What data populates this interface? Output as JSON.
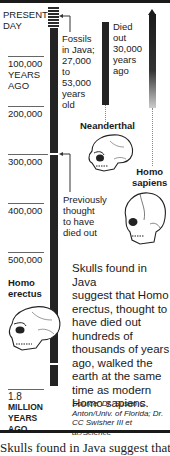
{
  "timeline": {
    "ticks": [
      {
        "label": "PRESENT\nDAY",
        "line1": "PRESENT",
        "line2": "DAY"
      },
      {
        "line1": "100,000",
        "line2": "YEARS",
        "line3": "AGO"
      },
      {
        "line1": "200,000"
      },
      {
        "line1": "300,000"
      },
      {
        "line1": "400,000"
      },
      {
        "line1": "500,000"
      },
      {
        "line1": "1.8",
        "line2": "MILLION",
        "line3": "YEARS",
        "line4": "AGO"
      }
    ]
  },
  "annotations": {
    "fossils": [
      "Fossils",
      "in Java;",
      "27,000",
      "to",
      "53,000",
      "years",
      "old"
    ],
    "neanderthal_died": [
      "Died",
      "out",
      "30,000",
      "years",
      "ago"
    ],
    "previously": [
      "Previously",
      "thought",
      "to have",
      "died out"
    ]
  },
  "species": {
    "neanderthal": "Neanderthal",
    "homo_sapiens": [
      "Homo",
      "sapiens"
    ],
    "homo_erectus": [
      "Homo",
      "erectus"
    ]
  },
  "body_text": [
    "Skulls found in Java",
    "suggest that Homo",
    "erectus, thought to",
    "have died out",
    "hundreds of",
    "thousands of years",
    "ago, walked the",
    "earth at the same",
    "time as modern",
    "Homo sapiens."
  ],
  "source": [
    "Source: Dr. Susan C.",
    "Anton/Univ. of Florida; Dr.",
    "CC Swisher III et",
    "al./Science"
  ],
  "caption": "Skulls found in Java suggest that Homo erectus"
}
